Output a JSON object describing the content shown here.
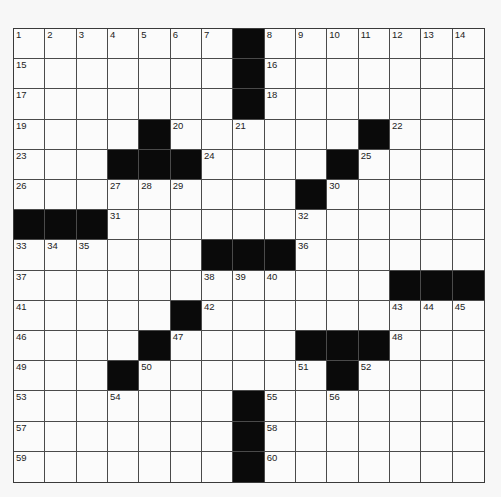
{
  "puzzle": {
    "rows": 15,
    "cols": 15,
    "colors": {
      "black": "#0a0a0a",
      "white": "#fbfbfb",
      "line": "#4a4a4a",
      "background": "#f7f7f7"
    },
    "grid": [
      [
        "1",
        "2",
        "3",
        "4",
        "5",
        "6",
        "7",
        "#",
        "8",
        "9",
        "10",
        "11",
        "12",
        "13",
        "14"
      ],
      [
        "15",
        "",
        "",
        "",
        "",
        "",
        "",
        "#",
        "16",
        "",
        "",
        "",
        "",
        "",
        ""
      ],
      [
        "17",
        "",
        "",
        "",
        "",
        "",
        "",
        "#",
        "18",
        "",
        "",
        "",
        "",
        "",
        ""
      ],
      [
        "19",
        "",
        "",
        "",
        "#",
        "20",
        "",
        "21",
        "",
        "",
        "",
        "#",
        "22",
        "",
        ""
      ],
      [
        "23",
        "",
        "",
        "#",
        "#",
        "#",
        "24",
        "",
        "",
        "",
        "#",
        "25",
        "",
        "",
        ""
      ],
      [
        "26",
        "",
        "",
        "27",
        "28",
        "29",
        "",
        "",
        "",
        "#",
        "30",
        "",
        "",
        "",
        ""
      ],
      [
        "#",
        "#",
        "#",
        "31",
        "",
        "",
        "",
        "",
        "",
        "32",
        "",
        "",
        "",
        "",
        ""
      ],
      [
        "33",
        "34",
        "35",
        "",
        "",
        "",
        "#",
        "#",
        "#",
        "36",
        "",
        "",
        "",
        "",
        ""
      ],
      [
        "37",
        "",
        "",
        "",
        "",
        "",
        "38",
        "39",
        "40",
        "",
        "",
        "",
        "#",
        "#",
        "#"
      ],
      [
        "41",
        "",
        "",
        "",
        "",
        "#",
        "42",
        "",
        "",
        "",
        "",
        "",
        "43",
        "44",
        "45"
      ],
      [
        "46",
        "",
        "",
        "",
        "#",
        "47",
        "",
        "",
        "",
        "#",
        "#",
        "#",
        "48",
        "",
        ""
      ],
      [
        "49",
        "",
        "",
        "#",
        "50",
        "",
        "",
        "",
        "",
        "51",
        "#",
        "52",
        "",
        "",
        ""
      ],
      [
        "53",
        "",
        "",
        "54",
        "",
        "",
        "",
        "#",
        "55",
        "",
        "56",
        "",
        "",
        "",
        ""
      ],
      [
        "57",
        "",
        "",
        "",
        "",
        "",
        "",
        "#",
        "58",
        "",
        "",
        "",
        "",
        "",
        ""
      ],
      [
        "59",
        "",
        "",
        "",
        "",
        "",
        "",
        "#",
        "60",
        "",
        "",
        "",
        "",
        "",
        ""
      ]
    ]
  }
}
